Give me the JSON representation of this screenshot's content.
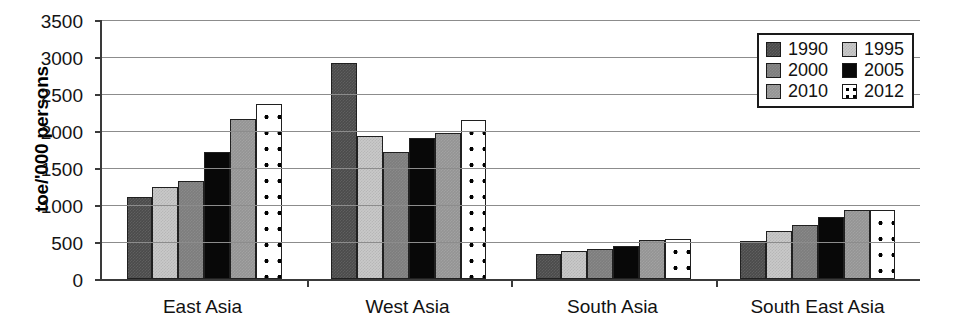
{
  "chart_data": {
    "type": "bar",
    "title": "",
    "xlabel": "",
    "ylabel": "toe/'000 persons",
    "ylim": [
      0,
      3500
    ],
    "ytick_step": 500,
    "yticks": [
      3500,
      3000,
      2500,
      2000,
      1500,
      1000,
      500,
      0
    ],
    "grid": true,
    "legend_position": "top-right",
    "categories": [
      "East Asia",
      "West Asia",
      "South Asia",
      "South East Asia"
    ],
    "series": [
      {
        "name": "1990",
        "color": "#4b4b4b",
        "pattern": "dark-gray-dither",
        "values": [
          1110,
          2920,
          340,
          520
        ]
      },
      {
        "name": "1995",
        "color": "#c9c9c9",
        "pattern": "light-gray-dither",
        "values": [
          1240,
          1930,
          380,
          650
        ]
      },
      {
        "name": "2000",
        "color": "#7d7d7d",
        "pattern": "medium-gray-dither",
        "values": [
          1330,
          1720,
          400,
          730
        ]
      },
      {
        "name": "2005",
        "color": "#080808",
        "pattern": "solid-black",
        "values": [
          1720,
          1900,
          450,
          840
        ]
      },
      {
        "name": "2010",
        "color": "#949494",
        "pattern": "gray-dither",
        "values": [
          2160,
          1970,
          530,
          930
        ]
      },
      {
        "name": "2012",
        "color": "#ffffff",
        "pattern": "white-with-black-dots",
        "values": [
          2360,
          2150,
          540,
          930
        ]
      }
    ]
  },
  "legend": {
    "items": [
      {
        "label": "1990"
      },
      {
        "label": "1995"
      },
      {
        "label": "2000"
      },
      {
        "label": "2005"
      },
      {
        "label": "2010"
      },
      {
        "label": "2012"
      }
    ]
  }
}
